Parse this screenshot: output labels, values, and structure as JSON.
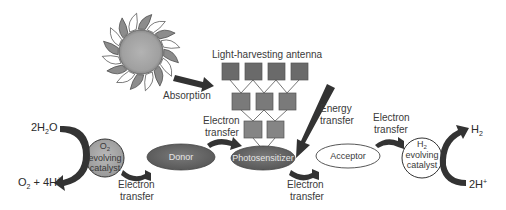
{
  "diagram": {
    "labels": {
      "absorption": "Absorption",
      "antenna": "Light-harvesting antenna",
      "energy_transfer_1": "Energy",
      "energy_transfer_2": "transfer",
      "et_top_left_1": "Electron",
      "et_top_left_2": "transfer",
      "et_bottom_left_1": "Electron",
      "et_bottom_left_2": "transfer",
      "et_bottom_mid_1": "Electron",
      "et_bottom_mid_2": "transfer",
      "et_top_right_1": "Electron",
      "et_top_right_2": "transfer"
    },
    "nodes": {
      "donor": "Donor",
      "photosensitizer": "Photosensitizer",
      "acceptor": "Acceptor",
      "o2_catalyst": {
        "line1_main": "O",
        "line1_sub": "2",
        "line2": "evolving",
        "line3": "catalyst"
      },
      "h2_catalyst": {
        "line1_main": "H",
        "line1_sub": "2",
        "line2": "evolving",
        "line3": "catalyst"
      }
    },
    "chemicals": {
      "water": {
        "pre": "2H",
        "sub": "2",
        "post": "O"
      },
      "oxygen_protons": {
        "o": "O",
        "o_sub": "2",
        "rest": " + 4H",
        "sup": "+"
      },
      "hydrogen": {
        "main": "H",
        "sub": "2"
      },
      "protons": {
        "main": "2H",
        "sup": "+"
      }
    },
    "antenna_rows": [
      4,
      3,
      2
    ],
    "colors": {
      "arrow": "#333333",
      "square_fill": "#6e6e6e",
      "ellipse_dark": "#666666",
      "catalyst_fill": "#a8a8a8",
      "sun_core": "#a9a9a9"
    }
  }
}
